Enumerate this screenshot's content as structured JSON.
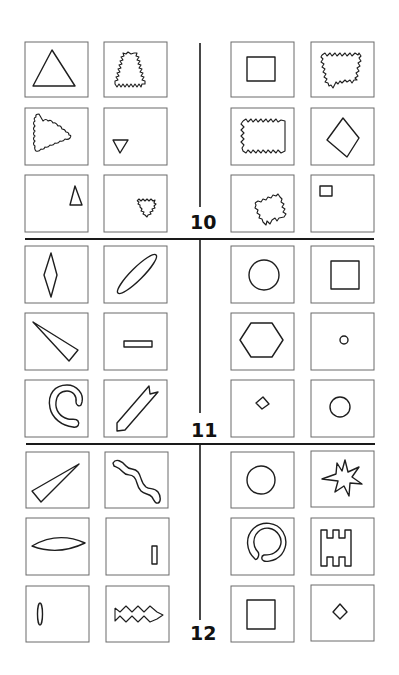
{
  "sheet": {
    "type": "Bongard problems",
    "colors": {
      "ink": "#1e1e1e",
      "frame": "#6a6a6a",
      "background": "#ffffff"
    }
  },
  "problems": [
    {
      "number": "10",
      "left_panels": [
        {
          "shape": "large triangle outline"
        },
        {
          "shape": "triangle with zigzag outline"
        },
        {
          "shape": "triangle with wavy outline pointing right"
        },
        {
          "shape": "small inverted triangle"
        },
        {
          "shape": "small narrow triangle"
        },
        {
          "shape": "small inverted zigzag triangle"
        }
      ],
      "right_panels": [
        {
          "shape": "square outline"
        },
        {
          "shape": "quadrilateral with zigzag outline"
        },
        {
          "shape": "rectangle with zigzag outline"
        },
        {
          "shape": "rotated quadrilateral (diamond)"
        },
        {
          "shape": "tilted square with zigzag outline"
        },
        {
          "shape": "tiny square in upper-left"
        }
      ]
    },
    {
      "number": "11",
      "left_panels": [
        {
          "shape": "vertical elongated rhombus"
        },
        {
          "shape": "diagonal elongated ellipse"
        },
        {
          "shape": "long thin wedge triangle"
        },
        {
          "shape": "small horizontal rectangle"
        },
        {
          "shape": "curved horseshoe band"
        },
        {
          "shape": "diagonal arrow-tail strip"
        }
      ],
      "right_panels": [
        {
          "shape": "circle"
        },
        {
          "shape": "square"
        },
        {
          "shape": "hexagon"
        },
        {
          "shape": "tiny circle"
        },
        {
          "shape": "small diamond"
        },
        {
          "shape": "small circle"
        }
      ]
    },
    {
      "number": "12",
      "left_panels": [
        {
          "shape": "thin wedge triangle pointing up-right"
        },
        {
          "shape": "wavy snake band"
        },
        {
          "shape": "horizontal lens"
        },
        {
          "shape": "small vertical bar"
        },
        {
          "shape": "thin vertical ellipse"
        },
        {
          "shape": "zigzag band"
        }
      ],
      "right_panels": [
        {
          "shape": "circle"
        },
        {
          "shape": "seven-pointed star"
        },
        {
          "shape": "open ring (C-shape band)"
        },
        {
          "shape": "castle comb shape"
        },
        {
          "shape": "square"
        },
        {
          "shape": "small diamond"
        }
      ]
    }
  ]
}
